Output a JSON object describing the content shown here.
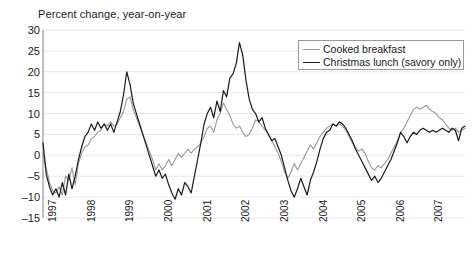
{
  "chart_data": {
    "type": "line",
    "title": "Percent change, year-on-year",
    "xlabel": "",
    "ylabel": "",
    "ylim": [
      -15,
      30
    ],
    "xlim": [
      1997.0,
      2007.92
    ],
    "ytick_labels": [
      "30",
      "25",
      "20",
      "15",
      "10",
      "5",
      "0",
      "-5",
      "-10",
      "-15"
    ],
    "ytick_values": [
      30,
      25,
      20,
      15,
      10,
      5,
      0,
      -5,
      -10,
      -15
    ],
    "xtick_labels": [
      "1997",
      "1998",
      "1999",
      "2000",
      "2001",
      "2002",
      "2003",
      "2004",
      "2005",
      "2006",
      "2007"
    ],
    "xtick_values": [
      1997,
      1998,
      1999,
      2000,
      2001,
      2002,
      2003,
      2004,
      2005,
      2006,
      2007
    ],
    "grid": true,
    "legend_position": "top-right",
    "colors": {
      "cooked_breakfast": "#999999",
      "christmas_lunch": "#1a1a1a",
      "grid": "#e8e8e8",
      "axis": "#808080"
    },
    "series": [
      {
        "name": "Cooked breakfast",
        "color": "#999999",
        "values": [
          0.5,
          -3.0,
          -6.5,
          -8.5,
          -9.0,
          -7.5,
          -9.5,
          -5.0,
          -6.0,
          -3.0,
          -7.0,
          -2.0,
          0.5,
          2.0,
          2.5,
          4.0,
          4.5,
          5.5,
          6.0,
          7.5,
          7.0,
          8.0,
          7.0,
          7.5,
          9.0,
          10.5,
          13.5,
          14.0,
          11.0,
          9.0,
          7.0,
          5.0,
          3.0,
          1.0,
          -1.0,
          -3.5,
          -2.0,
          -3.5,
          -2.5,
          -1.0,
          -2.5,
          -1.0,
          0.5,
          -0.5,
          0.5,
          1.5,
          0.5,
          1.5,
          2.0,
          3.0,
          4.5,
          6.5,
          7.0,
          5.5,
          8.5,
          10.0,
          12.5,
          11.0,
          9.5,
          7.5,
          6.5,
          7.0,
          5.5,
          4.5,
          5.0,
          6.5,
          8.5,
          8.0,
          7.0,
          6.0,
          5.0,
          3.5,
          2.0,
          0.5,
          -1.5,
          -4.0,
          -5.5,
          -4.0,
          -2.0,
          -3.5,
          -2.0,
          -0.5,
          1.0,
          2.5,
          1.5,
          3.0,
          4.5,
          5.5,
          6.5,
          7.0,
          7.5,
          7.0,
          7.5,
          7.0,
          6.0,
          4.5,
          3.0,
          2.0,
          1.0,
          1.5,
          0.5,
          -1.5,
          -3.0,
          -3.5,
          -2.5,
          -3.0,
          -2.0,
          -1.0,
          0.5,
          2.0,
          3.5,
          5.5,
          6.5,
          8.0,
          9.5,
          11.0,
          11.5,
          11.0,
          11.5,
          12.0,
          11.0,
          10.5,
          10.0,
          9.0,
          8.5,
          7.5,
          6.5,
          6.0,
          6.5,
          5.5,
          6.0,
          6.5
        ]
      },
      {
        "name": "Christmas lunch (savory only)",
        "color": "#1a1a1a",
        "values": [
          3.0,
          -4.5,
          -7.5,
          -9.5,
          -8.0,
          -10.0,
          -6.5,
          -9.5,
          -4.5,
          -8.0,
          -5.0,
          -1.0,
          2.0,
          4.5,
          5.5,
          7.5,
          6.0,
          8.0,
          6.5,
          7.5,
          6.0,
          7.5,
          5.5,
          8.0,
          10.5,
          14.5,
          20.0,
          17.0,
          12.5,
          10.0,
          7.5,
          5.0,
          2.5,
          0.0,
          -2.5,
          -5.0,
          -3.5,
          -5.5,
          -4.5,
          -7.0,
          -9.0,
          -10.5,
          -8.0,
          -9.5,
          -6.5,
          -7.5,
          -9.0,
          -5.0,
          -1.0,
          3.0,
          7.5,
          10.0,
          11.5,
          9.0,
          13.0,
          10.5,
          15.5,
          14.0,
          18.5,
          19.5,
          22.0,
          27.0,
          24.0,
          18.0,
          13.5,
          11.0,
          10.0,
          8.0,
          9.0,
          6.5,
          5.0,
          3.5,
          4.0,
          2.0,
          0.0,
          -3.0,
          -6.0,
          -8.5,
          -10.0,
          -8.0,
          -5.5,
          -7.5,
          -9.5,
          -6.0,
          -4.0,
          -1.5,
          1.5,
          4.0,
          5.5,
          6.0,
          7.5,
          7.0,
          8.0,
          7.5,
          6.5,
          5.0,
          3.5,
          1.5,
          0.0,
          -1.5,
          -3.0,
          -4.5,
          -6.0,
          -5.0,
          -6.5,
          -5.5,
          -4.0,
          -2.5,
          -1.0,
          1.0,
          3.0,
          5.5,
          4.5,
          3.0,
          4.5,
          5.5,
          5.0,
          6.0,
          6.5,
          6.0,
          5.5,
          6.0,
          5.5,
          6.0,
          6.5,
          6.0,
          5.5,
          6.5,
          6.0,
          3.5,
          6.5,
          7.0
        ]
      }
    ]
  }
}
